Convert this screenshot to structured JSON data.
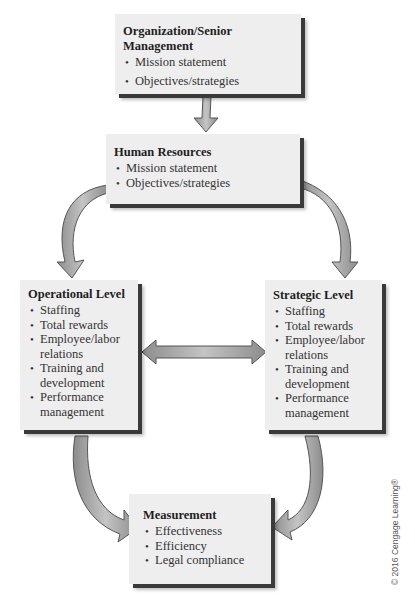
{
  "diagram": {
    "nodes": [
      {
        "id": "org",
        "title": "Organization/Senior Management",
        "items": [
          "Mission statement",
          "Objectives/strategies"
        ]
      },
      {
        "id": "hr",
        "title": "Human Resources",
        "items": [
          "Mission statement",
          "Objectives/strategies"
        ]
      },
      {
        "id": "operational",
        "title": "Operational Level",
        "items": [
          "Staffing",
          "Total rewards",
          "Employee/labor relations",
          "Training and development",
          "Performance management"
        ]
      },
      {
        "id": "strategic",
        "title": "Strategic Level",
        "items": [
          "Staffing",
          "Total rewards",
          "Employee/labor relations",
          "Training and development",
          "Performance management"
        ]
      },
      {
        "id": "measurement",
        "title": "Measurement",
        "items": [
          "Effectiveness",
          "Efficiency",
          "Legal compliance"
        ]
      }
    ],
    "edges": [
      {
        "from": "org",
        "to": "hr",
        "type": "arrow"
      },
      {
        "from": "hr",
        "to": "operational",
        "type": "curved-arrow"
      },
      {
        "from": "hr",
        "to": "strategic",
        "type": "curved-arrow"
      },
      {
        "from": "operational",
        "to": "strategic",
        "type": "double-arrow"
      },
      {
        "from": "operational",
        "to": "measurement",
        "type": "curved-arrow"
      },
      {
        "from": "strategic",
        "to": "measurement",
        "type": "curved-arrow"
      }
    ],
    "colors": {
      "box_fill": "#eeeeee",
      "box_shadow": "#3a3a3a",
      "arrow_fill": "#a8a8a8",
      "arrow_stroke": "#555555"
    }
  },
  "copyright": "© 2016 Cengage Learning®"
}
